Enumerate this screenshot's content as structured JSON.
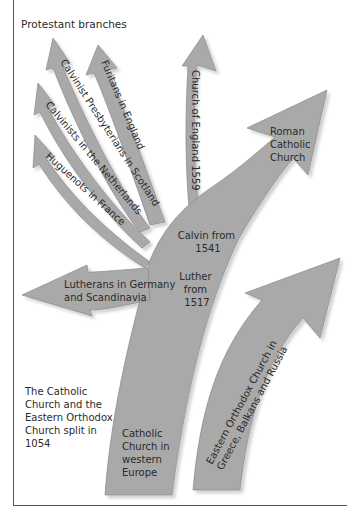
{
  "diagram": {
    "title": "Protestant branches",
    "note": [
      "The Catholic",
      "Church and the",
      "Eastern Orthodox",
      "Church split in",
      "1054"
    ],
    "colors": {
      "arrow_fill": "#a9a9a9",
      "arrow_stroke": "#8a8a8a",
      "shadow": "#d6d6d6",
      "text": "#2a2a2a",
      "frame": "#555555"
    },
    "branches": {
      "calvinist_presbyterians": "Calvinist Presbyterians in Scotland",
      "puritans": "Furitans in England",
      "calvinists_netherlands": "Calvinists in the Netherlands",
      "huguenots": "Huguenots in France",
      "church_of_england": "Church of England 1559",
      "roman_catholic": [
        "Roman",
        "Catholic",
        "Church"
      ],
      "lutherans": [
        "Lutherans in Germany",
        "and Scandinavia"
      ],
      "calvin": [
        "Calvin from",
        "1541"
      ],
      "luther": [
        "Luther",
        "from",
        "1517"
      ],
      "catholic_west": [
        "Catholic",
        "Church in",
        "western",
        "Europe"
      ],
      "eastern_orthodox": [
        "Eastern Orthodox Church in",
        "Greece, Balkans and Russia"
      ]
    }
  }
}
